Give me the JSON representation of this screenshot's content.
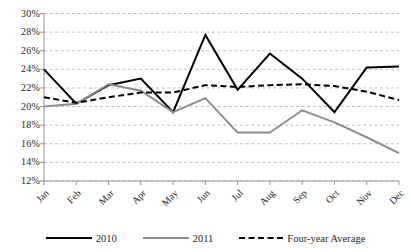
{
  "chart_data": {
    "type": "line",
    "title": "",
    "subtitle": "",
    "xlabel": "",
    "ylabel": "",
    "ylim": [
      12,
      30
    ],
    "ystep": 2,
    "grid": true,
    "grid_style": "dashed-horizontal",
    "legend_position": "bottom",
    "yticks": [
      "12%",
      "14%",
      "16%",
      "18%",
      "20%",
      "22%",
      "24%",
      "26%",
      "28%",
      "30%"
    ],
    "ytick_values": [
      12,
      14,
      16,
      18,
      20,
      22,
      24,
      26,
      28,
      30
    ],
    "categories": [
      "Jan",
      "Feb",
      "Mar",
      "Apr",
      "May",
      "Jun",
      "Jul",
      "Aug",
      "Sep",
      "Oct",
      "Nov",
      "Dec"
    ],
    "series": [
      {
        "name": "2010",
        "color": "#000000",
        "style": "solid",
        "values": [
          24.0,
          20.3,
          22.3,
          23.0,
          19.4,
          27.7,
          21.8,
          25.7,
          23.0,
          19.4,
          24.2,
          24.3
        ]
      },
      {
        "name": "2011",
        "color": "#8c8c8c",
        "style": "solid",
        "values": [
          20.0,
          20.3,
          22.4,
          21.7,
          19.4,
          20.9,
          17.2,
          17.2,
          19.6,
          18.3,
          16.7,
          15.0
        ]
      },
      {
        "name": "Four-year Average",
        "color": "#000000",
        "style": "dashed",
        "values": [
          21.0,
          20.4,
          21.0,
          21.5,
          21.5,
          22.3,
          22.1,
          22.3,
          22.4,
          22.2,
          21.6,
          20.7
        ]
      }
    ]
  },
  "legend": {
    "items": [
      {
        "label": "2010"
      },
      {
        "label": "2011"
      },
      {
        "label": "Four-year Average"
      }
    ]
  },
  "colors": {
    "series_2010": "#000000",
    "series_2011": "#8c8c8c",
    "series_average": "#000000",
    "grid": "#b5b5b5",
    "axis": "#9a9a9a",
    "text": "#1f1f1f",
    "background": "#ffffff"
  }
}
